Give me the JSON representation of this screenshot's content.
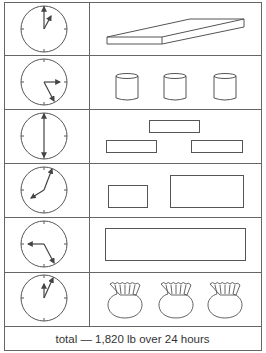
{
  "table": {
    "stroke_color": "#555555",
    "rows": [
      {
        "clock": {
          "label": "1:00",
          "hour_angle": 28,
          "minute_angle": 0
        },
        "objects": {
          "type": "slab",
          "count": 1
        }
      },
      {
        "clock": {
          "label": "3:25",
          "hour_angle": 90,
          "minute_angle": 152
        },
        "objects": {
          "type": "cylinder",
          "count": 3
        }
      },
      {
        "clock": {
          "label": "6:00",
          "hour_angle": 180,
          "minute_angle": 0
        },
        "objects": {
          "type": "bar",
          "count": 3
        }
      },
      {
        "clock": {
          "label": "8:05",
          "hour_angle": 243,
          "minute_angle": 25
        },
        "objects": {
          "type": "rectangle",
          "count": 2
        }
      },
      {
        "clock": {
          "label": "9:25",
          "hour_angle": 270,
          "minute_angle": 152
        },
        "objects": {
          "type": "long-rectangle",
          "count": 1
        }
      },
      {
        "clock": {
          "label": "12:05",
          "hour_angle": 0,
          "minute_angle": 28
        },
        "objects": {
          "type": "sack",
          "count": 3
        }
      }
    ]
  },
  "footer": {
    "text": "total — 1,820 lb over 24 hours"
  }
}
